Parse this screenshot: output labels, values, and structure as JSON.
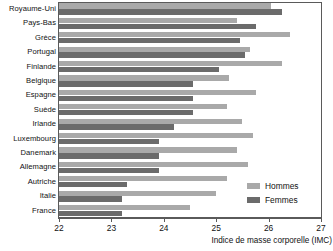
{
  "chart_data": {
    "type": "bar",
    "orientation": "horizontal",
    "title": "",
    "xlabel": "Indice de masse corporelle (IMC)",
    "ylabel": "",
    "xlim": [
      22,
      27
    ],
    "xticks": [
      22,
      23,
      24,
      25,
      26,
      27
    ],
    "xtick_labels": [
      "22",
      "23",
      "24",
      "25",
      "26",
      "27"
    ],
    "grid": false,
    "legend_position": "center-right",
    "categories": [
      "Royaume-Uni",
      "Pays-Bas",
      "Grèce",
      "Portugal",
      "Finlande",
      "Belgique",
      "Espagne",
      "Suède",
      "Irlande",
      "Luxembourg",
      "Danemark",
      "Allemagne",
      "Autriche",
      "Italie",
      "France"
    ],
    "series": [
      {
        "name": "Hommes",
        "color": "#a9a9a9",
        "values": [
          26.05,
          25.4,
          26.4,
          25.65,
          26.25,
          25.25,
          25.75,
          25.2,
          25.5,
          25.7,
          25.4,
          25.6,
          25.2,
          25.0,
          24.5
        ]
      },
      {
        "name": "Femmes",
        "color": "#6b6b6b",
        "values": [
          26.25,
          25.75,
          25.45,
          25.55,
          25.05,
          24.55,
          24.55,
          24.55,
          24.2,
          23.9,
          23.9,
          23.9,
          23.3,
          23.2,
          23.2
        ]
      }
    ],
    "legend": [
      {
        "label": "Hommes",
        "color": "#a9a9a9"
      },
      {
        "label": "Femmes",
        "color": "#6b6b6b"
      }
    ]
  }
}
